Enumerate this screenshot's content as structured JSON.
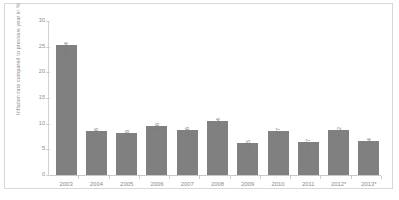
{
  "chart_data": {
    "type": "bar",
    "title": "",
    "subtitle": "",
    "xlabel": "",
    "ylabel": "Inflation rate compared to previous year in %",
    "categories": [
      "2003",
      "2004",
      "2005",
      "2006",
      "2007",
      "2008",
      "2009",
      "2010",
      "2011",
      "2012*",
      "2013*"
    ],
    "values": [
      25.34,
      8.6,
      8.18,
      9.6,
      8.76,
      10.44,
      6.25,
      8.57,
      6.47,
      8.72,
      6.54
    ],
    "value_labels": [
      "25,34",
      "8,6",
      "8,18",
      "9,6",
      "8,76",
      "10,44",
      "6,25",
      "8,57",
      "6,47",
      "8,72",
      "6,54"
    ],
    "ylim": [
      0,
      30
    ],
    "ytick_labels": [
      "0",
      "5",
      "10",
      "15",
      "20",
      "25",
      "30"
    ],
    "ytick_values": [
      0,
      5,
      10,
      15,
      20,
      25,
      30
    ],
    "grid": false,
    "legend": null,
    "legend_position": "none",
    "series": [
      {
        "name": "Inflation rate",
        "values": [
          25.34,
          8.6,
          8.18,
          9.6,
          8.76,
          10.44,
          6.25,
          8.57,
          6.47,
          8.72,
          6.54
        ]
      }
    ],
    "colors": {
      "bar": "#808080",
      "axis": "#cfcfcf",
      "text": "#8b8b8b",
      "frame": "#d8d8d8",
      "background": "#ffffff"
    }
  }
}
